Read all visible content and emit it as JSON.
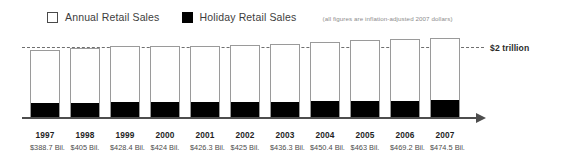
{
  "legend": {
    "items": [
      {
        "label": "Annual Retail Sales",
        "swatch": "hollow-square-icon",
        "color": "#ffffff"
      },
      {
        "label": "Holiday Retail Sales",
        "swatch": "filled-square-icon",
        "color": "#000000"
      }
    ],
    "note": "(all figures are inflation-adjusted 2007 dollars)"
  },
  "reference_line": {
    "label": "$2 trillion",
    "value": 2000
  },
  "chart_data": {
    "type": "bar",
    "title": "",
    "subtitle": "(all figures are inflation-adjusted 2007 dollars)",
    "xlabel": "",
    "ylabel": "",
    "grid": false,
    "legend_position": "top-left",
    "categories": [
      "1997",
      "1998",
      "1999",
      "2000",
      "2001",
      "2002",
      "2003",
      "2004",
      "2005",
      "2006",
      "2007"
    ],
    "series": [
      {
        "name": "Annual Retail Sales",
        "values": [
          1930,
          1990,
          2050,
          2060,
          2060,
          2080,
          2120,
          2180,
          2220,
          2260,
          2290
        ],
        "unit": "billions of 2007 dollars"
      },
      {
        "name": "Holiday Retail Sales",
        "values": [
          388.7,
          405,
          428.4,
          424,
          426.3,
          425,
          436.3,
          450.4,
          463,
          469.2,
          474.5
        ],
        "unit": "billions of 2007 dollars",
        "labels": [
          "$388.7 Bil.",
          "$405 Bil.",
          "$428.4 Bil.",
          "$424 Bil.",
          "$426.3 Bil.",
          "$425 Bil.",
          "$436.3 Bil.",
          "$450.4 Bil.",
          "$463 Bil.",
          "$469.2 Bil.",
          "$474.5 Bil."
        ]
      }
    ],
    "annotations": [
      {
        "type": "hline",
        "value": 2000,
        "label": "$2 trillion",
        "style": "dashed"
      }
    ],
    "ylim": [
      0,
      2400
    ],
    "colors": {
      "annual": "#ffffff",
      "annual_border": "#9a9a9a",
      "holiday": "#000000",
      "axis": "#4d4d4d"
    }
  },
  "axis": {
    "tick_labels": [
      {
        "year": "1997",
        "value": "$388.7 Bil."
      },
      {
        "year": "1998",
        "value": "$405 Bil."
      },
      {
        "year": "1999",
        "value": "$428.4 Bil."
      },
      {
        "year": "2000",
        "value": "$424 Bil."
      },
      {
        "year": "2001",
        "value": "$426.3 Bil."
      },
      {
        "year": "2002",
        "value": "$425 Bil."
      },
      {
        "year": "2003",
        "value": "$436.3 Bil."
      },
      {
        "year": "2004",
        "value": "$450.4 Bil."
      },
      {
        "year": "2005",
        "value": "$463 Bil."
      },
      {
        "year": "2006",
        "value": "$469.2 Bil."
      },
      {
        "year": "2007",
        "value": "$474.5 Bil."
      }
    ]
  }
}
